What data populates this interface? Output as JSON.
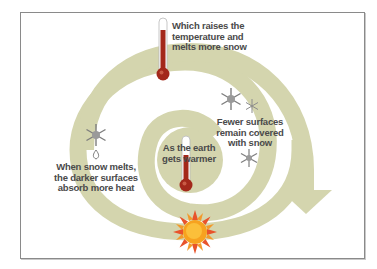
{
  "diagram": {
    "colors": {
      "band": "#d4d5ae",
      "text": "#4a4a4a",
      "thermometer_red": "#a3281b",
      "sun_orange": "#f5a623",
      "snowflake_gray": "#7d7d7d",
      "frame_border": "#8a8a8a"
    },
    "steps": [
      {
        "id": "start",
        "lines": [
          "As the earth",
          "gets warmer"
        ],
        "icon": "thermometer-icon"
      },
      {
        "id": "fewer-surfaces",
        "lines": [
          "Fewer surfaces",
          "remain covered",
          "with snow"
        ],
        "icon": "snowflake-icon"
      },
      {
        "id": "darker-surfaces",
        "lines": [
          "When snow melts,",
          "the darker surfaces",
          "absorb more heat"
        ],
        "icon": "melting-snowflake-icon"
      },
      {
        "id": "raises-temp",
        "lines": [
          "Which raises the",
          "temperature and",
          "melts more snow"
        ],
        "icon": "thermometer-icon"
      }
    ],
    "sun_icon": "sun-icon",
    "arrow_icon": "arrow-down-icon"
  }
}
